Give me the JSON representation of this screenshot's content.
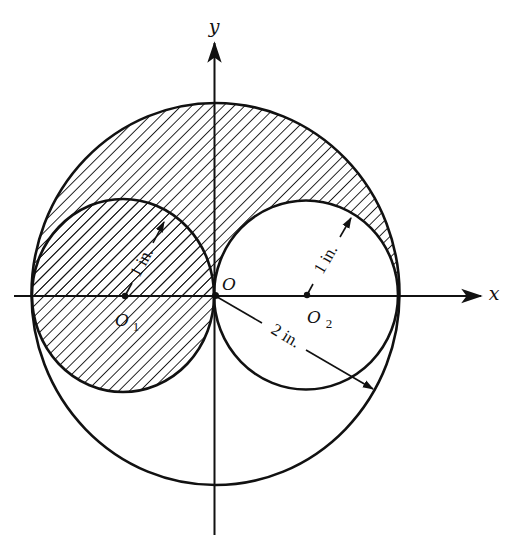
{
  "figure": {
    "type": "geometry-diagram",
    "axes": {
      "x_label": "x",
      "y_label": "y"
    },
    "points": {
      "origin": "O",
      "left_center": "O",
      "left_center_sub": "1",
      "right_center": "O",
      "right_center_sub": "2"
    },
    "dimensions": {
      "left_radius": "1 in.",
      "right_radius": "1 in.",
      "outer_radius": "2 in."
    },
    "circles": [
      {
        "name": "outer",
        "center": "O",
        "radius_in": 2
      },
      {
        "name": "left",
        "center": "O1",
        "radius_in": 1
      },
      {
        "name": "right",
        "center": "O2",
        "radius_in": 1
      }
    ],
    "shading": "diagonal hatching",
    "colors": {
      "ink": "#111111",
      "background": "#ffffff"
    }
  }
}
